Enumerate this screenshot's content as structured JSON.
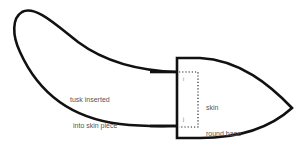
{
  "diagram": {
    "labels": {
      "tusk": [
        "tusk inserted",
        "into skin piece"
      ],
      "skin": [
        "skin",
        "round base",
        "of tusk"
      ],
      "mark_top": "i",
      "mark_bottom": "j"
    },
    "colors": {
      "outline": "#111111",
      "text": "#555555",
      "background": "#ffffff"
    }
  }
}
